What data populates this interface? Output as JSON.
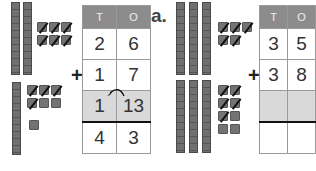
{
  "example": {
    "label": "",
    "headers": [
      "T",
      "O"
    ],
    "rows": [
      [
        "2",
        "6"
      ],
      [
        "1",
        "7"
      ],
      [
        "1",
        "13"
      ],
      [
        "4",
        "3"
      ]
    ],
    "operator": "+",
    "regroup_arrow": "13 ones → 1 ten carried"
  },
  "problem_a": {
    "label": "a.",
    "headers": [
      "T",
      "O"
    ],
    "rows": [
      [
        "3",
        "5"
      ],
      [
        "3",
        "8"
      ],
      [
        "",
        ""
      ],
      [
        "",
        ""
      ]
    ],
    "operator": "+"
  },
  "colors": {
    "header": "#8c8c8c",
    "shaded_row": "#d9d9d9",
    "blocks": "#707070"
  }
}
